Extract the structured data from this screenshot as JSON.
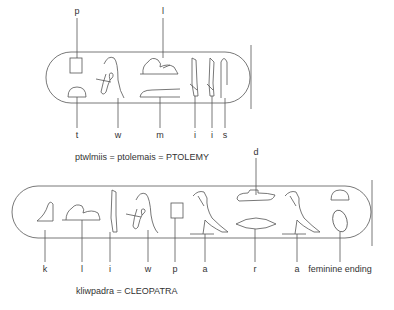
{
  "cartouche_ptolemy": {
    "top_labels": [
      {
        "text": "p",
        "x": 77
      },
      {
        "text": "l",
        "x": 163
      }
    ],
    "bottom_labels": [
      {
        "text": "t",
        "x": 77
      },
      {
        "text": "w",
        "x": 118
      },
      {
        "text": "m",
        "x": 160
      },
      {
        "text": "i",
        "x": 195
      },
      {
        "text": "i",
        "x": 212
      },
      {
        "text": "s",
        "x": 225
      }
    ],
    "caption": "ptwlmiis = ptolemais = PTOLEMY"
  },
  "cartouche_cleopatra": {
    "top_labels": [
      {
        "text": "d",
        "x": 256
      }
    ],
    "bottom_labels": [
      {
        "text": "k",
        "x": 45
      },
      {
        "text": "l",
        "x": 82
      },
      {
        "text": "i",
        "x": 110
      },
      {
        "text": "w",
        "x": 148
      },
      {
        "text": "p",
        "x": 175
      },
      {
        "text": "a",
        "x": 205
      },
      {
        "text": "r",
        "x": 255
      },
      {
        "text": "a",
        "x": 297
      },
      {
        "text": "feminine ending",
        "x": 340
      }
    ],
    "caption": "kliwpadra = CLEOPATRA"
  },
  "colors": {
    "line": "#555555",
    "text": "#333333",
    "background": "#ffffff"
  }
}
